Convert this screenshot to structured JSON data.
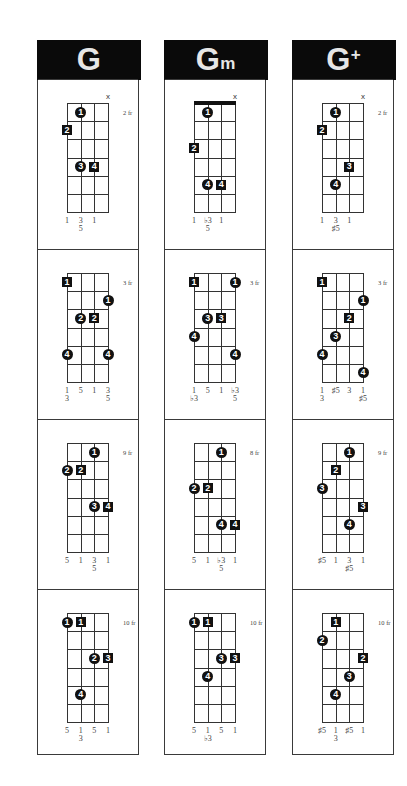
{
  "columns": [
    {
      "name": "G",
      "suffix": "",
      "suffix_style": "",
      "left": 37,
      "diagrams": [
        {
          "fret_label": "2 fr",
          "barre": false,
          "mute": [
            4
          ],
          "marks": [
            {
              "type": "circle",
              "label": "1",
              "string": 2,
              "fret": 1
            },
            {
              "type": "square",
              "label": "2",
              "string": 1,
              "fret": 2,
              "edge": true
            },
            {
              "type": "circle",
              "label": "3",
              "string": 2,
              "fret": 4
            },
            {
              "type": "square",
              "label": "4",
              "string": 3,
              "fret": 4
            }
          ],
          "degrees": [
            [
              "1"
            ],
            [
              "3",
              "5"
            ],
            [
              "1"
            ],
            []
          ]
        },
        {
          "fret_label": "3 fr",
          "barre": false,
          "mute": [],
          "marks": [
            {
              "type": "square",
              "label": "1",
              "string": 1,
              "fret": 1
            },
            {
              "type": "circle",
              "label": "1",
              "string": 4,
              "fret": 2
            },
            {
              "type": "circle",
              "label": "2",
              "string": 2,
              "fret": 3
            },
            {
              "type": "square",
              "label": "2",
              "string": 3,
              "fret": 3
            },
            {
              "type": "circle",
              "label": "4",
              "string": 1,
              "fret": 5
            },
            {
              "type": "circle",
              "label": "4",
              "string": 4,
              "fret": 5
            }
          ],
          "degrees": [
            [
              "1",
              "3"
            ],
            [
              "5"
            ],
            [
              "1"
            ],
            [
              "3",
              "5"
            ]
          ]
        },
        {
          "fret_label": "9 fr",
          "barre": false,
          "mute": [],
          "marks": [
            {
              "type": "circle",
              "label": "1",
              "string": 3,
              "fret": 1
            },
            {
              "type": "circle",
              "label": "2",
              "string": 1,
              "fret": 2
            },
            {
              "type": "square",
              "label": "2",
              "string": 2,
              "fret": 2
            },
            {
              "type": "circle",
              "label": "3",
              "string": 3,
              "fret": 4
            },
            {
              "type": "square",
              "label": "4",
              "string": 4,
              "fret": 4
            }
          ],
          "degrees": [
            [
              "5"
            ],
            [
              "1"
            ],
            [
              "3",
              "5"
            ],
            [
              "1"
            ]
          ]
        },
        {
          "fret_label": "10 fr",
          "barre": false,
          "mute": [],
          "marks": [
            {
              "type": "circle",
              "label": "1",
              "string": 1,
              "fret": 1
            },
            {
              "type": "square",
              "label": "1",
              "string": 2,
              "fret": 1
            },
            {
              "type": "circle",
              "label": "2",
              "string": 3,
              "fret": 3
            },
            {
              "type": "square",
              "label": "3",
              "string": 4,
              "fret": 3
            },
            {
              "type": "circle",
              "label": "4",
              "string": 2,
              "fret": 5
            }
          ],
          "degrees": [
            [
              "5"
            ],
            [
              "1",
              "3"
            ],
            [
              "5"
            ],
            [
              "1"
            ]
          ]
        }
      ]
    },
    {
      "name": "G",
      "suffix": "m",
      "suffix_style": "sub",
      "left": 164,
      "diagrams": [
        {
          "fret_label": "",
          "barre": true,
          "mute": [
            4
          ],
          "marks": [
            {
              "type": "circle",
              "label": "1",
              "string": 2,
              "fret": 1
            },
            {
              "type": "square",
              "label": "2",
              "string": 1,
              "fret": 3
            },
            {
              "type": "circle",
              "label": "4",
              "string": 2,
              "fret": 5
            },
            {
              "type": "square",
              "label": "4",
              "string": 3,
              "fret": 5
            }
          ],
          "degrees": [
            [
              "1"
            ],
            [
              "♭3",
              "5"
            ],
            [
              "1"
            ],
            []
          ]
        },
        {
          "fret_label": "3 fr",
          "barre": false,
          "mute": [],
          "marks": [
            {
              "type": "square",
              "label": "1",
              "string": 1,
              "fret": 1
            },
            {
              "type": "circle",
              "label": "1",
              "string": 4,
              "fret": 1
            },
            {
              "type": "circle",
              "label": "3",
              "string": 2,
              "fret": 3
            },
            {
              "type": "square",
              "label": "3",
              "string": 3,
              "fret": 3
            },
            {
              "type": "circle",
              "label": "4",
              "string": 1,
              "fret": 4
            },
            {
              "type": "circle",
              "label": "4",
              "string": 4,
              "fret": 5
            }
          ],
          "degrees": [
            [
              "1",
              "♭3"
            ],
            [
              "5"
            ],
            [
              "1"
            ],
            [
              "♭3",
              "5"
            ]
          ]
        },
        {
          "fret_label": "8 fr",
          "barre": false,
          "mute": [],
          "marks": [
            {
              "type": "circle",
              "label": "1",
              "string": 3,
              "fret": 1
            },
            {
              "type": "circle",
              "label": "2",
              "string": 1,
              "fret": 3
            },
            {
              "type": "square",
              "label": "2",
              "string": 2,
              "fret": 3
            },
            {
              "type": "circle",
              "label": "4",
              "string": 3,
              "fret": 5
            },
            {
              "type": "square",
              "label": "4",
              "string": 4,
              "fret": 5
            }
          ],
          "degrees": [
            [
              "5"
            ],
            [
              "1"
            ],
            [
              "♭3",
              "5"
            ],
            [
              "1"
            ]
          ]
        },
        {
          "fret_label": "10 fr",
          "barre": false,
          "mute": [],
          "marks": [
            {
              "type": "circle",
              "label": "1",
              "string": 1,
              "fret": 1
            },
            {
              "type": "square",
              "label": "1",
              "string": 2,
              "fret": 1
            },
            {
              "type": "circle",
              "label": "3",
              "string": 3,
              "fret": 3
            },
            {
              "type": "square",
              "label": "3",
              "string": 4,
              "fret": 3
            },
            {
              "type": "circle",
              "label": "4",
              "string": 2,
              "fret": 4
            }
          ],
          "degrees": [
            [
              "5"
            ],
            [
              "1",
              "♭3"
            ],
            [
              "5"
            ],
            [
              "1"
            ]
          ]
        }
      ]
    },
    {
      "name": "G",
      "suffix": "+",
      "suffix_style": "sup",
      "left": 292,
      "diagrams": [
        {
          "fret_label": "2 fr",
          "barre": false,
          "mute": [
            4
          ],
          "marks": [
            {
              "type": "circle",
              "label": "1",
              "string": 2,
              "fret": 1
            },
            {
              "type": "square",
              "label": "2",
              "string": 1,
              "fret": 2
            },
            {
              "type": "square",
              "label": "3",
              "string": 3,
              "fret": 4
            },
            {
              "type": "circle",
              "label": "4",
              "string": 2,
              "fret": 5
            }
          ],
          "degrees": [
            [
              "1"
            ],
            [
              "3",
              "♯5"
            ],
            [
              "1"
            ],
            []
          ]
        },
        {
          "fret_label": "3 fr",
          "barre": false,
          "mute": [],
          "marks": [
            {
              "type": "square",
              "label": "1",
              "string": 1,
              "fret": 1
            },
            {
              "type": "circle",
              "label": "1",
              "string": 4,
              "fret": 2
            },
            {
              "type": "square",
              "label": "2",
              "string": 3,
              "fret": 3
            },
            {
              "type": "circle",
              "label": "3",
              "string": 2,
              "fret": 4
            },
            {
              "type": "circle",
              "label": "4",
              "string": 1,
              "fret": 5
            },
            {
              "type": "circle",
              "label": "4",
              "string": 4,
              "fret": 6
            }
          ],
          "degrees": [
            [
              "1",
              "3"
            ],
            [
              "♯5"
            ],
            [
              "3"
            ],
            [
              "1",
              "♯5"
            ]
          ]
        },
        {
          "fret_label": "9 fr",
          "barre": false,
          "mute": [],
          "marks": [
            {
              "type": "circle",
              "label": "1",
              "string": 3,
              "fret": 1
            },
            {
              "type": "square",
              "label": "2",
              "string": 2,
              "fret": 2
            },
            {
              "type": "circle",
              "label": "3",
              "string": 1,
              "fret": 3
            },
            {
              "type": "square",
              "label": "3",
              "string": 4,
              "fret": 4
            },
            {
              "type": "circle",
              "label": "4",
              "string": 3,
              "fret": 5
            }
          ],
          "degrees": [
            [
              "♯5"
            ],
            [
              "1"
            ],
            [
              "3",
              "♯5"
            ],
            [
              "1"
            ]
          ]
        },
        {
          "fret_label": "10 fr",
          "barre": false,
          "mute": [],
          "marks": [
            {
              "type": "square",
              "label": "1",
              "string": 2,
              "fret": 1
            },
            {
              "type": "circle",
              "label": "2",
              "string": 1,
              "fret": 2
            },
            {
              "type": "square",
              "label": "2",
              "string": 4,
              "fret": 3
            },
            {
              "type": "circle",
              "label": "3",
              "string": 3,
              "fret": 4
            },
            {
              "type": "circle",
              "label": "4",
              "string": 2,
              "fret": 5
            }
          ],
          "degrees": [
            [
              "♯5"
            ],
            [
              "1",
              "3"
            ],
            [
              "♯5"
            ],
            [
              "1"
            ]
          ]
        }
      ]
    }
  ],
  "mute_symbol": "x"
}
